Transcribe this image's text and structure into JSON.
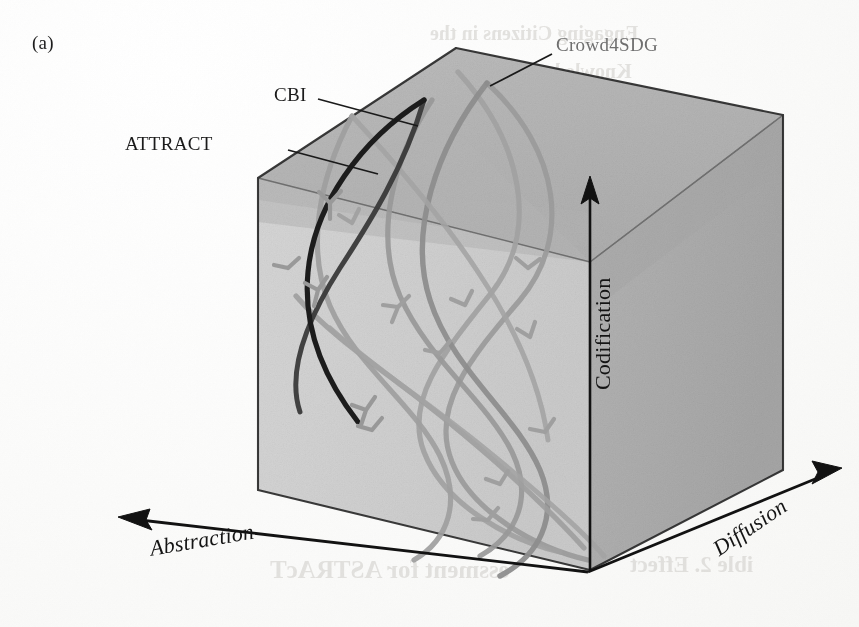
{
  "figure": {
    "panel_letter": "(a)",
    "background_color": "#fdfdfc"
  },
  "cube": {
    "top_face_color": "#b4b4b4",
    "left_face_color": "#d2d2d2",
    "right_face_color": "#aeaeae",
    "inner_shadow_color": "#bdbdbd",
    "edge_color": "#1a1a1a"
  },
  "axes": [
    {
      "name": "abstraction",
      "label": "Abstraction",
      "direction": "lower-left",
      "style": "italic-serif"
    },
    {
      "name": "codification",
      "label": "Codification",
      "direction": "up",
      "style": "serif"
    },
    {
      "name": "diffusion",
      "label": "Diffusion",
      "direction": "lower-right",
      "style": "italic-serif"
    }
  ],
  "callouts": [
    {
      "name": "attract",
      "label": "ATTRACT",
      "color": "#1a1a1a",
      "leader_from": [
        290,
        150
      ],
      "leader_to": [
        372,
        171
      ]
    },
    {
      "name": "cbi",
      "label": "CBI",
      "color": "#2e2e2e",
      "leader_from": [
        320,
        100
      ],
      "leader_to": [
        412,
        125
      ]
    },
    {
      "name": "crowd4sdg",
      "label": "Crowd4SDG",
      "color": "#7d7d7d",
      "leader_from": [
        551,
        54
      ],
      "leader_to": [
        487,
        83
      ]
    }
  ],
  "trajectories": [
    {
      "name": "attract",
      "label": "ATTRACT",
      "color": "#1d1d1d",
      "width": 5.0,
      "opacity": 1.0
    },
    {
      "name": "cbi",
      "label": "CBI",
      "color": "#3a3a3a",
      "width": 5.0,
      "opacity": 0.95
    },
    {
      "name": "crowd4sdg",
      "label": "Crowd4SDG",
      "color": "#8e8e8e",
      "width": 5.2,
      "opacity": 0.95
    },
    {
      "name": "spiral-d",
      "label": "",
      "color": "#999999",
      "width": 5.2,
      "opacity": 0.9
    },
    {
      "name": "spiral-e",
      "label": "",
      "color": "#a2a2a2",
      "width": 5.2,
      "opacity": 0.9
    },
    {
      "name": "spiral-f",
      "label": "",
      "color": "#9b9b9b",
      "width": 5.2,
      "opacity": 0.9
    }
  ],
  "bleed_through": [
    {
      "text": "Engaging Citizens in the",
      "x": 430,
      "y": 30,
      "size": 20
    },
    {
      "text": "Knowledge Society",
      "x": 470,
      "y": 70,
      "size": 20
    },
    {
      "text": "essment for ASTRAcT",
      "x": 300,
      "y": 570,
      "size": 24
    },
    {
      "text": "ible 2. Effect",
      "x": 640,
      "y": 568,
      "size": 22
    }
  ]
}
